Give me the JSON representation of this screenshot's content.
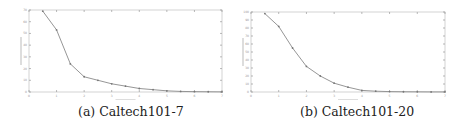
{
  "chart_data": [
    {
      "type": "line",
      "caption": "(a) Caltech101-7",
      "title": "",
      "xlabel": "",
      "ylabel": "",
      "grid": false,
      "x_ticks": [
        0,
        1,
        2,
        3,
        4,
        5,
        6,
        7
      ],
      "y_ticks": [
        0,
        10,
        20,
        30,
        40,
        50,
        60,
        70
      ],
      "xlim": [
        0,
        7
      ],
      "ylim": [
        0,
        70
      ],
      "series": [
        {
          "name": "curve",
          "x": [
            0.5,
            1.0,
            1.5,
            2.0,
            2.5,
            3.0,
            3.5,
            4.0,
            4.5,
            5.0,
            5.5,
            6.0,
            6.5,
            7.0
          ],
          "values": [
            69,
            53,
            24,
            13,
            10,
            7,
            5,
            3,
            2,
            1,
            0.5,
            0.3,
            0.2,
            0.1
          ]
        }
      ],
      "frame": {
        "x0": 29,
        "y0": 10,
        "x1": 222,
        "y1": 92
      }
    },
    {
      "type": "line",
      "caption": "(b) Caltech101-20",
      "title": "",
      "xlabel": "",
      "ylabel": "",
      "grid": false,
      "x_ticks": [
        0,
        1,
        2,
        3,
        4,
        5,
        6,
        7
      ],
      "y_ticks": [
        0,
        10,
        20,
        30,
        40,
        50,
        60,
        70,
        80,
        90,
        100
      ],
      "xlim": [
        0,
        7
      ],
      "ylim": [
        0,
        100
      ],
      "series": [
        {
          "name": "curve",
          "x": [
            0.5,
            1.0,
            1.5,
            2.0,
            2.5,
            3.0,
            3.5,
            4.0,
            4.5,
            5.0,
            5.5,
            6.0,
            6.5,
            7.0
          ],
          "values": [
            98,
            82,
            55,
            32,
            20,
            11,
            6,
            2,
            1,
            0.5,
            0.3,
            0.2,
            0.1,
            0.1
          ]
        }
      ],
      "frame": {
        "x0": 251,
        "y0": 12,
        "x1": 445,
        "y1": 92
      }
    }
  ],
  "captions": {
    "a": "(a) Caltech101-7",
    "b": "(b) Caltech101-20"
  }
}
